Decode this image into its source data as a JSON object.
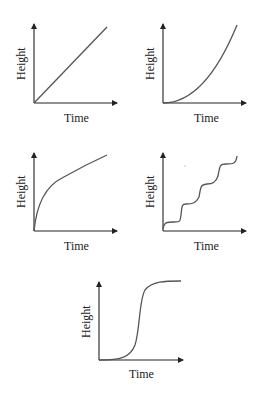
{
  "figure": {
    "panels": [
      {
        "id": "linear",
        "xlabel": "Time",
        "ylabel": "Height"
      },
      {
        "id": "accelerating",
        "xlabel": "Time",
        "ylabel": "Height"
      },
      {
        "id": "decelerating",
        "xlabel": "Time",
        "ylabel": "Height"
      },
      {
        "id": "stepwise",
        "xlabel": "Time",
        "ylabel": "Height"
      },
      {
        "id": "sigmoid",
        "xlabel": "Time",
        "ylabel": "Height"
      }
    ]
  },
  "colors": {
    "axis": "#222222",
    "curve": "#555555",
    "background": "#ffffff"
  }
}
